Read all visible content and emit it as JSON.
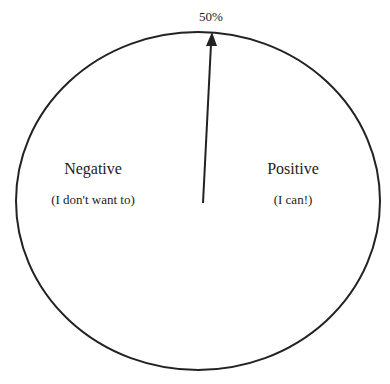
{
  "diagram": {
    "top_label": "50%",
    "left": {
      "title": "Negative",
      "subtitle": "(I don't want to)"
    },
    "right": {
      "title": "Positive",
      "subtitle": "(I can!)"
    },
    "colors": {
      "stroke": "#222222",
      "background": "#ffffff"
    }
  }
}
